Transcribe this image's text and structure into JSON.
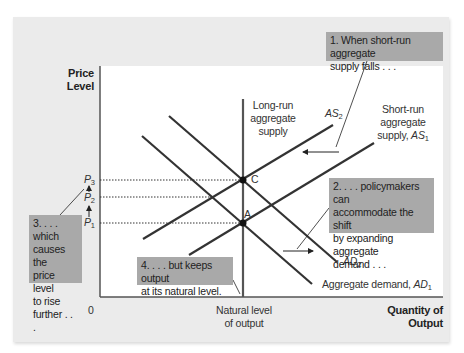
{
  "diagram": {
    "axes": {
      "y_label_line1": "Price",
      "y_label_line2": "Level",
      "x_label_line1": "Quantity of",
      "x_label_line2": "Output",
      "origin": "0",
      "natural_level_line1": "Natural level",
      "natural_level_line2": "of output"
    },
    "price_levels": [
      {
        "name": "P",
        "sub": "3"
      },
      {
        "name": "P",
        "sub": "2"
      },
      {
        "name": "P",
        "sub": "1"
      }
    ],
    "curves": {
      "lras_line1": "Long-run",
      "lras_line2": "aggregate",
      "lras_line3": "supply",
      "as2_name": "AS",
      "as2_sub": "2",
      "as1_line1": "Short-run",
      "as1_line2": "aggregate",
      "as1_prefix": "supply, ",
      "as1_name": "AS",
      "as1_sub": "1",
      "ad2_name": "AD",
      "ad2_sub": "2",
      "ad1_prefix": "Aggregate demand, ",
      "ad1_name": "AD",
      "ad1_sub": "1"
    },
    "points": {
      "a": "A",
      "c": "C"
    },
    "notes": {
      "n1_line1": "1. When short-run aggregate",
      "n1_line2": "supply falls . . .",
      "n2_line1": "2. . . . policymakers can",
      "n2_line2": "accommodate the shift",
      "n2_line3": "by expanding aggregate",
      "n2_line4": "demand . . .",
      "n3_line1": "3. . . . which",
      "n3_line2": "causes the",
      "n3_line3": "price level",
      "n3_line4": "to rise",
      "n3_line5": "further . . .",
      "n4_line1": "4. . . . but keeps output",
      "n4_line2": "at its natural level."
    },
    "colors": {
      "card_bg": "#ebebeb",
      "note_bg": "#a9a9a9",
      "line": "#333333",
      "axis": "#555555"
    }
  }
}
